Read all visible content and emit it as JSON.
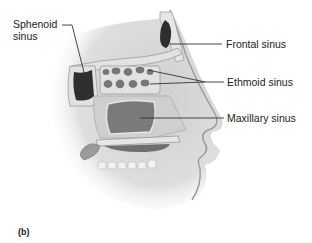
{
  "figure": {
    "panel_label": "(b)",
    "labels": {
      "sphenoid_line1": "Sphenoid",
      "sphenoid_line2": "sinus",
      "frontal": "Frontal sinus",
      "ethmoid": "Ethmoid sinus",
      "maxillary": "Maxillary sinus"
    },
    "colors": {
      "sinus_dark": "#2e2e2e",
      "sinus_mid": "#7a7a7a",
      "bone": "#e2e2e2",
      "tissue": "#bdbdbd",
      "skin_shadow": "#d8d8d8",
      "leader_line": "#333333"
    }
  }
}
